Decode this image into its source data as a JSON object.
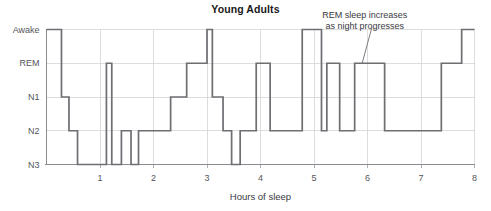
{
  "chart_data": {
    "type": "line",
    "title": "Young Adults",
    "xlabel": "Hours of sleep",
    "ylabel": "",
    "xlim": [
      0,
      8
    ],
    "xticks": [
      1,
      2,
      3,
      4,
      5,
      6,
      7,
      8
    ],
    "xtick_labels": [
      "1",
      "2",
      "3",
      "4",
      "5",
      "6",
      "7",
      "8"
    ],
    "ylim": [
      0,
      4
    ],
    "stages": [
      "N3",
      "N2",
      "N1",
      "REM",
      "Awake"
    ],
    "ytick_labels": [
      "Awake",
      "REM",
      "N1",
      "N2",
      "N3"
    ],
    "grid": true,
    "legend": null,
    "series": [
      {
        "name": "Sleep stage",
        "step": "post",
        "x": [
          0.0,
          0.28,
          0.28,
          0.42,
          0.42,
          0.58,
          0.58,
          1.12,
          1.12,
          1.22,
          1.22,
          1.4,
          1.4,
          1.58,
          1.58,
          1.72,
          1.72,
          2.32,
          2.32,
          2.62,
          2.62,
          3.0,
          3.0,
          3.1,
          3.1,
          3.3,
          3.3,
          3.46,
          3.46,
          3.62,
          3.62,
          3.92,
          3.92,
          4.18,
          4.18,
          4.78,
          4.78,
          5.14,
          5.14,
          5.24,
          5.24,
          5.48,
          5.48,
          5.76,
          5.76,
          6.32,
          6.32,
          7.38,
          7.38,
          7.76,
          7.76,
          8.0
        ],
        "y": [
          4,
          4,
          2,
          2,
          1,
          1,
          0,
          0,
          3,
          3,
          0,
          0,
          1,
          1,
          0,
          0,
          1,
          1,
          2,
          2,
          3,
          3,
          4,
          4,
          2,
          2,
          1,
          1,
          0,
          0,
          1,
          1,
          3,
          3,
          1,
          1,
          4,
          4,
          1,
          1,
          3,
          3,
          1,
          1,
          3,
          3,
          1,
          1,
          3,
          3,
          4,
          4
        ],
        "color": "#6e6e73"
      }
    ],
    "annotations": [
      {
        "text_lines": [
          "REM sleep increases",
          "as night progresses"
        ],
        "text_x": 5.95,
        "text_y": 4.35,
        "leader_from_x": 6.08,
        "leader_from_y": 4.05,
        "leader_to_x": 5.9,
        "leader_to_y": 3.0
      }
    ]
  },
  "axis": {
    "x_axis_title": "Hours of sleep"
  }
}
